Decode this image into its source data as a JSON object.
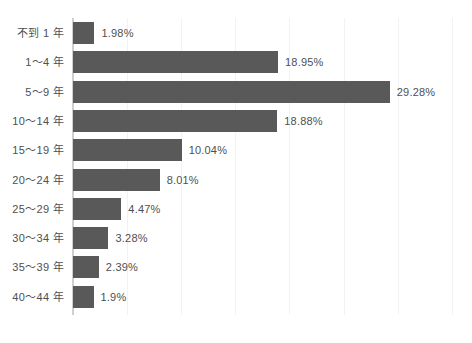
{
  "chart_data": {
    "type": "bar",
    "orientation": "horizontal",
    "title": "",
    "subtitle": "",
    "xlabel": "",
    "ylabel": "",
    "categories": [
      "不到 1 年",
      "1～4 年",
      "5～9 年",
      "10～14 年",
      "15～19 年",
      "20～24 年",
      "25～29 年",
      "30～34 年",
      "35～39 年",
      "40～44 年"
    ],
    "values": [
      1.98,
      18.95,
      29.28,
      18.88,
      10.04,
      8.01,
      4.47,
      3.28,
      2.39,
      1.9
    ],
    "value_labels": [
      "1.98%",
      "18.95%",
      "29.28%",
      "18.88%",
      "10.04%",
      "8.01%",
      "4.47%",
      "3.28%",
      "2.39%",
      "1.9%"
    ],
    "unit": "%",
    "xlim": [
      0,
      36.9
    ],
    "grid": {
      "vertical": true,
      "horizontal": false,
      "interval": 5,
      "ticks": [
        5,
        10,
        15,
        20,
        25,
        30,
        35
      ]
    },
    "tick_labels_visible": false,
    "legend": null,
    "legend_position": "none",
    "colors": {
      "bar": "#595959",
      "axis": "#cfcfcf",
      "gridline": "#f2f2f2",
      "label_text": "#4f4f4f",
      "background": "#ffffff"
    }
  },
  "layout": {
    "plot_left": 73,
    "plot_top": 18,
    "plot_bottom": 315,
    "plot_right": 472,
    "px_per_percent": 10.82,
    "bar_height": 22,
    "row_pitch": 29.3
  }
}
